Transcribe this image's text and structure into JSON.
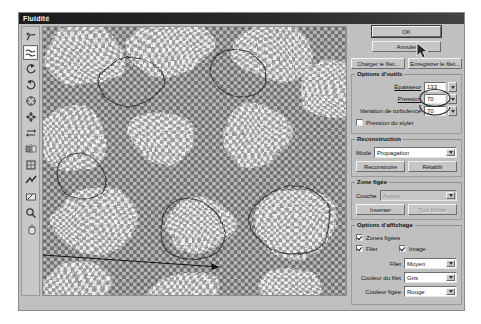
{
  "window": {
    "title": "Fluidité"
  },
  "toolbar": {
    "tools": [
      {
        "name": "warp-tool",
        "glyph": "warp",
        "selected": false
      },
      {
        "name": "turbulence-tool",
        "glyph": "turbulence",
        "selected": true
      },
      {
        "name": "twirl-clockwise-tool",
        "glyph": "twirl-cw",
        "selected": false
      },
      {
        "name": "twirl-counterclockwise-tool",
        "glyph": "twirl-ccw",
        "selected": false
      },
      {
        "name": "pucker-tool",
        "glyph": "pucker",
        "selected": false
      },
      {
        "name": "bloat-tool",
        "glyph": "bloat",
        "selected": false
      },
      {
        "name": "shift-pixels-tool",
        "glyph": "shift",
        "selected": false
      },
      {
        "name": "reflection-tool",
        "glyph": "reflect",
        "selected": false
      },
      {
        "name": "reconstruct-tool",
        "glyph": "reconstruct",
        "selected": false
      },
      {
        "name": "freeze-tool",
        "glyph": "freeze",
        "selected": false
      },
      {
        "name": "thaw-tool",
        "glyph": "thaw",
        "selected": false
      },
      {
        "name": "zoom-tool",
        "glyph": "magnifier",
        "selected": false
      },
      {
        "name": "hand-tool",
        "glyph": "hand",
        "selected": false
      }
    ]
  },
  "actions": {
    "ok_label": "OK",
    "cancel_label": "Annuler",
    "load_mesh_label": "Charger le filet...",
    "save_mesh_label": "Enregistrer le filet..."
  },
  "tool_options": {
    "group_label": "Options d'outils",
    "brush_size_label": "Épaisseur",
    "brush_size_value": "133",
    "pressure_label": "Pression",
    "pressure_value": "70",
    "turbulence_label": "Variation de turbulence",
    "turbulence_value": "70",
    "stylus_label": "Pression du stylet",
    "stylus_checked": false
  },
  "reconstruction": {
    "group_label": "Reconstruction",
    "mode_label": "Mode",
    "mode_value": "Propagation",
    "reconstruct_label": "Reconstruire",
    "revert_label": "Rétablir"
  },
  "frozen_area": {
    "group_label": "Zone figée",
    "channel_label": "Couche",
    "channel_value": "Aucun",
    "invert_label": "Inverser",
    "thaw_all_label": "Tout libérer"
  },
  "display_options": {
    "group_label": "Options d'affichage",
    "frozen_areas_label": "Zones figées",
    "frozen_areas_checked": true,
    "mesh_label": "Filet",
    "mesh_checked": true,
    "image_label": "Image",
    "image_checked": true,
    "mesh_size_label": "Filet",
    "mesh_size_value": "Moyen",
    "mesh_color_label": "Couleur du filet",
    "mesh_color_value": "Gris",
    "frozen_color_label": "Couleur figée",
    "frozen_color_value": "Rouge"
  },
  "colors": {
    "dialog_bg": "#c0c0c0",
    "titlebar": "#1b1b1b",
    "canvas_bg": "#b7b7b7",
    "mesh_line": "#6b6b6b",
    "highlight_ring": "#222222"
  }
}
